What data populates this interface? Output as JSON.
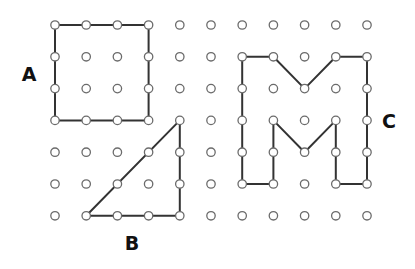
{
  "diagram": {
    "grid": {
      "columns": 11,
      "rows": 7,
      "origin_x": 55,
      "origin_y": 25,
      "step_x": 31.2,
      "step_y": 31.8,
      "dot_radius": 4.2
    },
    "colors": {
      "line": "#333333",
      "dot_stroke": "#6b6b6b",
      "dot_fill": "#ffffff",
      "label": "#111111"
    },
    "shapes": [
      {
        "id": "A",
        "name": "square",
        "label": "A",
        "label_pos": [
          29,
          74
        ],
        "vertices": [
          [
            0,
            0
          ],
          [
            3,
            0
          ],
          [
            3,
            3
          ],
          [
            0,
            3
          ]
        ]
      },
      {
        "id": "B",
        "name": "right-triangle",
        "label": "B",
        "label_pos": [
          132,
          243
        ],
        "vertices": [
          [
            4,
            3
          ],
          [
            4,
            6
          ],
          [
            1,
            6
          ]
        ]
      },
      {
        "id": "C",
        "name": "letter-m",
        "label": "C",
        "label_pos": [
          389,
          121
        ],
        "vertices": [
          [
            6,
            1
          ],
          [
            7,
            1
          ],
          [
            8,
            2
          ],
          [
            9,
            1
          ],
          [
            10,
            1
          ],
          [
            10,
            5
          ],
          [
            9,
            5
          ],
          [
            9,
            3
          ],
          [
            8,
            4
          ],
          [
            7,
            3
          ],
          [
            7,
            5
          ],
          [
            6,
            5
          ]
        ]
      }
    ]
  }
}
